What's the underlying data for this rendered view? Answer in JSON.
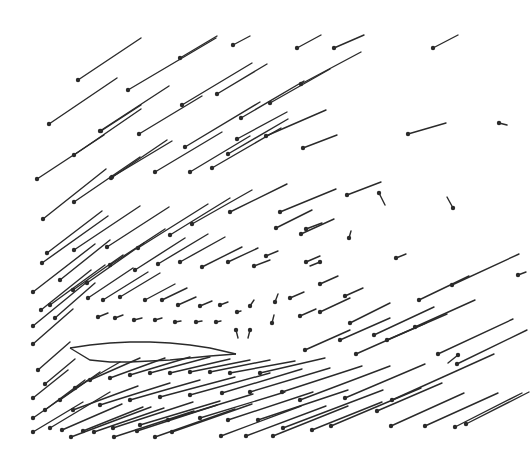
{
  "chart_data": {
    "type": "vector_field",
    "title": "",
    "xlabel": "",
    "ylabel": "",
    "grid": false,
    "legend": null,
    "style": {
      "line_color": "#2a2a2a",
      "background": "#ffffff",
      "dot_radius": 2.2
    },
    "airfoil": {
      "leading_edge": [
        70,
        348
      ],
      "trailing_edge": [
        236,
        354
      ],
      "upper_surface": [
        [
          70,
          348
        ],
        [
          90,
          345
        ],
        [
          110,
          343
        ],
        [
          130,
          342
        ],
        [
          150,
          342
        ],
        [
          170,
          343
        ],
        [
          190,
          345
        ],
        [
          210,
          348
        ],
        [
          236,
          354
        ]
      ],
      "lower_surface": [
        [
          70,
          348
        ],
        [
          90,
          360
        ],
        [
          110,
          362
        ],
        [
          130,
          362
        ],
        [
          150,
          361
        ],
        [
          170,
          360
        ],
        [
          190,
          358
        ],
        [
          210,
          356
        ],
        [
          236,
          354
        ]
      ]
    },
    "vectors": [
      {
        "x": 78,
        "y": 80,
        "dx": 63,
        "dy": -42
      },
      {
        "x": 128,
        "y": 90,
        "dx": 88,
        "dy": -52
      },
      {
        "x": 180,
        "y": 58,
        "dx": 37,
        "dy": -22
      },
      {
        "x": 233,
        "y": 45,
        "dx": 17,
        "dy": -9
      },
      {
        "x": 49,
        "y": 124,
        "dx": 68,
        "dy": -46
      },
      {
        "x": 100,
        "y": 131,
        "dx": 69,
        "dy": -45
      },
      {
        "x": 139,
        "y": 134,
        "dx": 63,
        "dy": -38
      },
      {
        "x": 182,
        "y": 105,
        "dx": 70,
        "dy": -42
      },
      {
        "x": 217,
        "y": 94,
        "dx": 50,
        "dy": -30
      },
      {
        "x": 297,
        "y": 48,
        "dx": 24,
        "dy": -13
      },
      {
        "x": 74,
        "y": 155,
        "dx": 67,
        "dy": -46
      },
      {
        "x": 101,
        "y": 131,
        "dx": 40,
        "dy": -26
      },
      {
        "x": 37,
        "y": 179,
        "dx": 67,
        "dy": -44
      },
      {
        "x": 112,
        "y": 177,
        "dx": 60,
        "dy": -36
      },
      {
        "x": 155,
        "y": 172,
        "dx": 67,
        "dy": -40
      },
      {
        "x": 185,
        "y": 147,
        "dx": 75,
        "dy": -45
      },
      {
        "x": 241,
        "y": 118,
        "dx": 63,
        "dy": -37
      },
      {
        "x": 270,
        "y": 103,
        "dx": 60,
        "dy": -34
      },
      {
        "x": 301,
        "y": 84,
        "dx": 60,
        "dy": -32
      },
      {
        "x": 334,
        "y": 48,
        "dx": 30,
        "dy": -13
      },
      {
        "x": 433,
        "y": 48,
        "dx": 25,
        "dy": -13
      },
      {
        "x": 408,
        "y": 134,
        "dx": 38,
        "dy": -11
      },
      {
        "x": 499,
        "y": 123,
        "dx": 8,
        "dy": 2
      },
      {
        "x": 43,
        "y": 219,
        "dx": 63,
        "dy": -50
      },
      {
        "x": 74,
        "y": 202,
        "dx": 66,
        "dy": -45
      },
      {
        "x": 111,
        "y": 178,
        "dx": 56,
        "dy": -38
      },
      {
        "x": 190,
        "y": 172,
        "dx": 60,
        "dy": -36
      },
      {
        "x": 212,
        "y": 168,
        "dx": 69,
        "dy": -40
      },
      {
        "x": 228,
        "y": 154,
        "dx": 60,
        "dy": -35
      },
      {
        "x": 237,
        "y": 139,
        "dx": 50,
        "dy": -27
      },
      {
        "x": 266,
        "y": 136,
        "dx": 60,
        "dy": -26
      },
      {
        "x": 303,
        "y": 148,
        "dx": 34,
        "dy": -13
      },
      {
        "x": 347,
        "y": 195,
        "dx": 34,
        "dy": -13
      },
      {
        "x": 379,
        "y": 193,
        "dx": 6,
        "dy": 12
      },
      {
        "x": 453,
        "y": 208,
        "dx": -6,
        "dy": -11
      },
      {
        "x": 42,
        "y": 263,
        "dx": 66,
        "dy": -47
      },
      {
        "x": 74,
        "y": 250,
        "dx": 66,
        "dy": -44
      },
      {
        "x": 107,
        "y": 247,
        "dx": 62,
        "dy": -40
      },
      {
        "x": 138,
        "y": 248,
        "dx": 70,
        "dy": -44
      },
      {
        "x": 170,
        "y": 235,
        "dx": 60,
        "dy": -37
      },
      {
        "x": 192,
        "y": 224,
        "dx": 60,
        "dy": -34
      },
      {
        "x": 230,
        "y": 212,
        "dx": 57,
        "dy": -28
      },
      {
        "x": 280,
        "y": 212,
        "dx": 56,
        "dy": -23
      },
      {
        "x": 301,
        "y": 234,
        "dx": 33,
        "dy": -15
      },
      {
        "x": 276,
        "y": 228,
        "dx": 36,
        "dy": -18
      },
      {
        "x": 306,
        "y": 229,
        "dx": 16,
        "dy": -6
      },
      {
        "x": 306,
        "y": 262,
        "dx": 14,
        "dy": -6
      },
      {
        "x": 349,
        "y": 238,
        "dx": 2,
        "dy": -7
      },
      {
        "x": 396,
        "y": 258,
        "dx": 10,
        "dy": -4
      },
      {
        "x": 320,
        "y": 262,
        "dx": -10,
        "dy": 4
      },
      {
        "x": 47,
        "y": 253,
        "dx": 55,
        "dy": -42
      },
      {
        "x": 60,
        "y": 280,
        "dx": 50,
        "dy": -40
      },
      {
        "x": 33,
        "y": 292,
        "dx": 62,
        "dy": -48
      },
      {
        "x": 50,
        "y": 305,
        "dx": 55,
        "dy": -40
      },
      {
        "x": 73,
        "y": 290,
        "dx": 50,
        "dy": -35
      },
      {
        "x": 87,
        "y": 283,
        "dx": 57,
        "dy": -40
      },
      {
        "x": 110,
        "y": 265,
        "dx": 55,
        "dy": -36
      },
      {
        "x": 135,
        "y": 270,
        "dx": 50,
        "dy": -32
      },
      {
        "x": 158,
        "y": 264,
        "dx": 50,
        "dy": -30
      },
      {
        "x": 180,
        "y": 262,
        "dx": 45,
        "dy": -25
      },
      {
        "x": 202,
        "y": 267,
        "dx": 40,
        "dy": -20
      },
      {
        "x": 228,
        "y": 262,
        "dx": 30,
        "dy": -14
      },
      {
        "x": 254,
        "y": 266,
        "dx": 16,
        "dy": -6
      },
      {
        "x": 266,
        "y": 256,
        "dx": 12,
        "dy": -5
      },
      {
        "x": 33,
        "y": 326,
        "dx": 55,
        "dy": -45
      },
      {
        "x": 41,
        "y": 310,
        "dx": 50,
        "dy": -40
      },
      {
        "x": 55,
        "y": 318,
        "dx": 40,
        "dy": -35
      },
      {
        "x": 33,
        "y": 344,
        "dx": 40,
        "dy": -35
      },
      {
        "x": 38,
        "y": 370,
        "dx": 32,
        "dy": -28
      },
      {
        "x": 33,
        "y": 398,
        "dx": 35,
        "dy": -28
      },
      {
        "x": 45,
        "y": 384,
        "dx": 30,
        "dy": -25
      },
      {
        "x": 88,
        "y": 298,
        "dx": 45,
        "dy": -30
      },
      {
        "x": 103,
        "y": 300,
        "dx": 45,
        "dy": -28
      },
      {
        "x": 120,
        "y": 297,
        "dx": 40,
        "dy": -24
      },
      {
        "x": 145,
        "y": 300,
        "dx": 30,
        "dy": -16
      },
      {
        "x": 162,
        "y": 300,
        "dx": 25,
        "dy": -12
      },
      {
        "x": 178,
        "y": 305,
        "dx": 18,
        "dy": -8
      },
      {
        "x": 200,
        "y": 306,
        "dx": 12,
        "dy": -5
      },
      {
        "x": 220,
        "y": 305,
        "dx": 8,
        "dy": -3
      },
      {
        "x": 237,
        "y": 312,
        "dx": 4,
        "dy": -1
      },
      {
        "x": 250,
        "y": 306,
        "dx": 4,
        "dy": -6
      },
      {
        "x": 275,
        "y": 302,
        "dx": 3,
        "dy": -8
      },
      {
        "x": 290,
        "y": 298,
        "dx": 14,
        "dy": -6
      },
      {
        "x": 320,
        "y": 284,
        "dx": 18,
        "dy": -8
      },
      {
        "x": 345,
        "y": 296,
        "dx": 18,
        "dy": -8
      },
      {
        "x": 98,
        "y": 317,
        "dx": 10,
        "dy": -4
      },
      {
        "x": 115,
        "y": 318,
        "dx": 8,
        "dy": -3
      },
      {
        "x": 134,
        "y": 320,
        "dx": 8,
        "dy": -2
      },
      {
        "x": 155,
        "y": 320,
        "dx": 7,
        "dy": -2
      },
      {
        "x": 175,
        "y": 322,
        "dx": 6,
        "dy": -1
      },
      {
        "x": 196,
        "y": 322,
        "dx": 6,
        "dy": -1
      },
      {
        "x": 216,
        "y": 322,
        "dx": 5,
        "dy": -1
      },
      {
        "x": 236,
        "y": 330,
        "dx": 2,
        "dy": 8
      },
      {
        "x": 250,
        "y": 330,
        "dx": -2,
        "dy": 8
      },
      {
        "x": 272,
        "y": 323,
        "dx": 2,
        "dy": -8
      },
      {
        "x": 300,
        "y": 316,
        "dx": 16,
        "dy": -7
      },
      {
        "x": 320,
        "y": 312,
        "dx": 30,
        "dy": -14
      },
      {
        "x": 350,
        "y": 323,
        "dx": 40,
        "dy": -20
      },
      {
        "x": 374,
        "y": 335,
        "dx": 60,
        "dy": -28
      },
      {
        "x": 415,
        "y": 327,
        "dx": 60,
        "dy": -27
      },
      {
        "x": 438,
        "y": 354,
        "dx": 75,
        "dy": -35
      },
      {
        "x": 305,
        "y": 350,
        "dx": 45,
        "dy": -20
      },
      {
        "x": 340,
        "y": 340,
        "dx": 50,
        "dy": -22
      },
      {
        "x": 387,
        "y": 340,
        "dx": 60,
        "dy": -26
      },
      {
        "x": 419,
        "y": 300,
        "dx": 50,
        "dy": -24
      },
      {
        "x": 452,
        "y": 285,
        "dx": 67,
        "dy": -31
      },
      {
        "x": 518,
        "y": 275,
        "dx": 8,
        "dy": -3
      },
      {
        "x": 33,
        "y": 418,
        "dx": 55,
        "dy": -38
      },
      {
        "x": 50,
        "y": 428,
        "dx": 60,
        "dy": -36
      },
      {
        "x": 33,
        "y": 432,
        "dx": 50,
        "dy": -30
      },
      {
        "x": 45,
        "y": 410,
        "dx": 40,
        "dy": -30
      },
      {
        "x": 60,
        "y": 400,
        "dx": 40,
        "dy": -28
      },
      {
        "x": 75,
        "y": 388,
        "dx": 45,
        "dy": -26
      },
      {
        "x": 90,
        "y": 380,
        "dx": 50,
        "dy": -22
      },
      {
        "x": 110,
        "y": 378,
        "dx": 55,
        "dy": -20
      },
      {
        "x": 130,
        "y": 375,
        "dx": 60,
        "dy": -18
      },
      {
        "x": 150,
        "y": 373,
        "dx": 60,
        "dy": -16
      },
      {
        "x": 170,
        "y": 373,
        "dx": 60,
        "dy": -14
      },
      {
        "x": 190,
        "y": 372,
        "dx": 60,
        "dy": -12
      },
      {
        "x": 210,
        "y": 372,
        "dx": 60,
        "dy": -12
      },
      {
        "x": 230,
        "y": 373,
        "dx": 65,
        "dy": -12
      },
      {
        "x": 260,
        "y": 373,
        "dx": 65,
        "dy": -15
      },
      {
        "x": 73,
        "y": 410,
        "dx": 65,
        "dy": -24
      },
      {
        "x": 100,
        "y": 405,
        "dx": 70,
        "dy": -22
      },
      {
        "x": 130,
        "y": 400,
        "dx": 70,
        "dy": -20
      },
      {
        "x": 160,
        "y": 397,
        "dx": 75,
        "dy": -20
      },
      {
        "x": 190,
        "y": 395,
        "dx": 80,
        "dy": -22
      },
      {
        "x": 222,
        "y": 393,
        "dx": 80,
        "dy": -24
      },
      {
        "x": 250,
        "y": 392,
        "dx": 80,
        "dy": -24
      },
      {
        "x": 282,
        "y": 392,
        "dx": 80,
        "dy": -26
      },
      {
        "x": 300,
        "y": 400,
        "dx": 90,
        "dy": -34
      },
      {
        "x": 345,
        "y": 398,
        "dx": 80,
        "dy": -34
      },
      {
        "x": 62,
        "y": 430,
        "dx": 60,
        "dy": -26
      },
      {
        "x": 83,
        "y": 431,
        "dx": 60,
        "dy": -24
      },
      {
        "x": 113,
        "y": 428,
        "dx": 80,
        "dy": -26
      },
      {
        "x": 140,
        "y": 425,
        "dx": 80,
        "dy": -24
      },
      {
        "x": 168,
        "y": 420,
        "dx": 85,
        "dy": -26
      },
      {
        "x": 200,
        "y": 418,
        "dx": 85,
        "dy": -26
      },
      {
        "x": 228,
        "y": 420,
        "dx": 85,
        "dy": -28
      },
      {
        "x": 258,
        "y": 420,
        "dx": 90,
        "dy": -30
      },
      {
        "x": 283,
        "y": 428,
        "dx": 100,
        "dy": -38
      },
      {
        "x": 71,
        "y": 437,
        "dx": 80,
        "dy": -30
      },
      {
        "x": 94,
        "y": 432,
        "dx": 70,
        "dy": -24
      },
      {
        "x": 114,
        "y": 437,
        "dx": 80,
        "dy": -26
      },
      {
        "x": 137,
        "y": 431,
        "dx": 80,
        "dy": -26
      },
      {
        "x": 155,
        "y": 437,
        "dx": 80,
        "dy": -28
      },
      {
        "x": 172,
        "y": 432,
        "dx": 80,
        "dy": -28
      },
      {
        "x": 221,
        "y": 436,
        "dx": 80,
        "dy": -30
      },
      {
        "x": 246,
        "y": 436,
        "dx": 80,
        "dy": -30
      },
      {
        "x": 273,
        "y": 436,
        "dx": 75,
        "dy": -30
      },
      {
        "x": 312,
        "y": 430,
        "dx": 70,
        "dy": -28
      },
      {
        "x": 331,
        "y": 426,
        "dx": 90,
        "dy": -38
      },
      {
        "x": 392,
        "y": 400,
        "dx": 102,
        "dy": -46
      },
      {
        "x": 391,
        "y": 426,
        "dx": 73,
        "dy": -33
      },
      {
        "x": 455,
        "y": 427,
        "dx": 67,
        "dy": -34
      },
      {
        "x": 425,
        "y": 426,
        "dx": 73,
        "dy": -33
      },
      {
        "x": 466,
        "y": 424,
        "dx": 63,
        "dy": -32
      },
      {
        "x": 356,
        "y": 354,
        "dx": 70,
        "dy": -31
      },
      {
        "x": 377,
        "y": 411,
        "dx": 65,
        "dy": -28
      },
      {
        "x": 458,
        "y": 355,
        "dx": -10,
        "dy": 8
      },
      {
        "x": 457,
        "y": 364,
        "dx": 70,
        "dy": -34
      }
    ]
  }
}
